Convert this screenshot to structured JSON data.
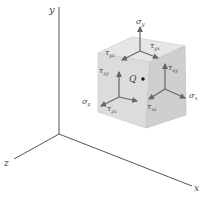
{
  "diagram": {
    "axes": {
      "x_label": "x",
      "y_label": "y",
      "z_label": "z",
      "color": "#555555"
    },
    "point": {
      "label": "Q"
    },
    "colors": {
      "top_face": "#e6e6e6",
      "front_face": "#dcdcdc",
      "right_face": "#cfcfcf",
      "edge": "#d8d8d8",
      "arrow": "#666666",
      "label": "#444444"
    },
    "top_face": {
      "normal": {
        "sym": "σ",
        "sub": "y"
      },
      "shear1": {
        "sym": "τ",
        "sub": "yz"
      },
      "shear2": {
        "sym": "τ",
        "sub": "yx"
      }
    },
    "front_face": {
      "normal": {
        "sym": "σ",
        "sub": "z"
      },
      "shear1": {
        "sym": "τ",
        "sub": "zy"
      },
      "shear2": {
        "sym": "τ",
        "sub": "zx"
      }
    },
    "right_face": {
      "normal": {
        "sym": "σ",
        "sub": "x"
      },
      "shear1": {
        "sym": "τ",
        "sub": "xy"
      },
      "shear2": {
        "sym": "τ",
        "sub": "xz"
      }
    }
  }
}
